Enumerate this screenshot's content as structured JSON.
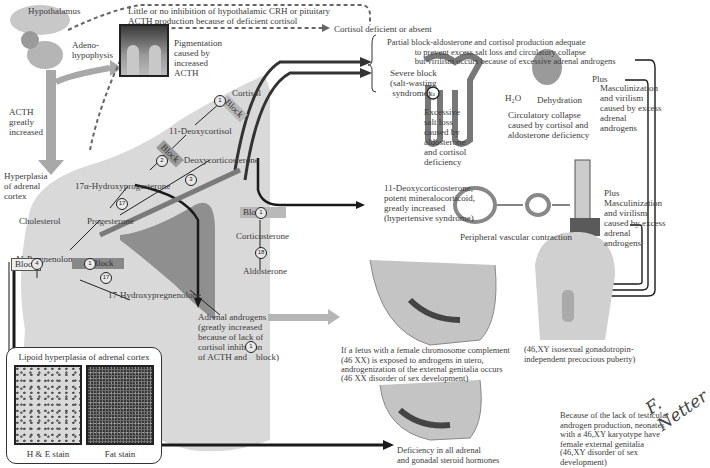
{
  "pituitary": {
    "hypothalamus": "Hypothalamus",
    "adenohypophysis": "Adeno-\nhypophysis",
    "acth": "ACTH\ngreatly\nincreased",
    "feedback_note": "Little or no inhibition of hypothalamic CRH or pituitary\nACTH production because of deficient cortisol",
    "pigmentation": "Pigmentation\ncaused by\nincreased\nACTH"
  },
  "cortex": {
    "hyperplasia": "Hyperplasia\nof adrenal\ncortex",
    "steroids": {
      "cholesterol": "Cholesterol",
      "pregnenolone": "Δ⁵-Pregnenolone",
      "progesterone": "Progesterone",
      "hydroxyprogesterone": "17α-Hydroxyprogesterone",
      "deoxycortisol": "11-Deoxycortisol",
      "cortisol": "Cortisol",
      "deoxycorticosterone": "11-Deoxycorticosterone",
      "corticosterone": "Corticosterone",
      "aldosterone": "Aldosterone",
      "hydroxypregnenolone": "17-Hydroxypregnenolone",
      "androgens": "Adrenal androgens\n(greatly increased\nbecause of lack of\ncortisol inhibition\nof ACTH and    block)"
    },
    "block_label": "Block",
    "enzymes": [
      "1",
      "2",
      "3",
      "4",
      "17",
      "18",
      "3",
      "11",
      "17",
      "21"
    ]
  },
  "outcomes": {
    "cortisol_deficient": "Cortisol deficient or absent",
    "partial_block": "Partial block-aldosterone and cortisol production adequate\n             to prevent excess salt loss and circulatory collapse\n             but virilism occurs because of excessive adrenal androgens",
    "severe_block": "Severe block\n(salt-wasting\n syndrome)",
    "na": "Na",
    "h2o": "H₂O",
    "dehydration": "Dehydration",
    "salt_loss": "Excessive\nsalt loss\ncaused by\naldosterone\nand cortisol\ndeficiency",
    "collapse": "Circulatory collapse\ncaused by cortisol and\naldosterone deficiency",
    "plus": "Plus",
    "masculinization": "Masculinization\nand virilism\ncaused by excess\nadrenal\nandrogens",
    "doc_increase": "11-Deoxycorticosterone,\npotent mineralocorticoid,\ngreatly increased\n(hypertensive syndrome)",
    "vascular": "Peripheral vascular contraction",
    "female_fetus": "If a fetus with a female chromosome complement\n(46 XX) is exposed to androgens in utero,\nandrogenization of the external genitalia occurs",
    "female_dsd": "(46 XX disorder of sex development)",
    "male_puberty": "(46,XY isosexual gonadotropin-\nindependent precocious puberty)",
    "deficiency_all": "Deficiency in all adrenal\nand gonadal steroid hormones",
    "xy_female": "Because of the lack of testicular\nandrogen production, neonates\nwith a 46,XY karyotype have\nfemale external genitalia",
    "xy_dsd": "(46,XY disorder of sex\ndevelopment)"
  },
  "histology": {
    "title": "Lipoid hyperplasia of adrenal cortex",
    "he": "H & E stain",
    "fat": "Fat stain"
  },
  "signature": "F. Netter",
  "colors": {
    "cortex": "#d9d9d9",
    "medulla": "#8f8f8f",
    "arrow_gray": "#a8a8a8",
    "line_dark": "#1a1a1a"
  }
}
